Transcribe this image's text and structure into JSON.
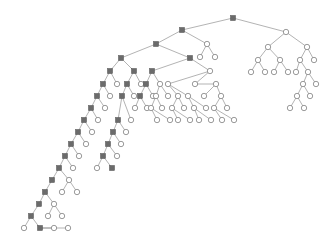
{
  "figure": {
    "kind": "binary-tree-diagram",
    "background_color": "#ffffff",
    "width": 326,
    "height": 245
  },
  "style": {
    "edge_color": "#808080",
    "edge_width": 0.6,
    "square_fill": "#6b6b6b",
    "square_stroke": "#4a4a4a",
    "square_size": 5.2,
    "circle_fill": "#ffffff",
    "circle_stroke": "#707070",
    "circle_radius": 2.7
  },
  "legend": {
    "square_meaning": "internal-marked-node",
    "circle_meaning": "unmarked-node"
  },
  "chart_data": {
    "type": "diagram",
    "title": "",
    "node_shapes": [
      "square",
      "circle"
    ],
    "node_count": 186,
    "root_id": 0,
    "nodes": [
      {
        "id": 0,
        "x": 233,
        "y": 18,
        "shape": "square"
      },
      {
        "id": 1,
        "x": 182,
        "y": 30,
        "shape": "square"
      },
      {
        "id": 2,
        "x": 286,
        "y": 32,
        "shape": "circle"
      },
      {
        "id": 3,
        "x": 156,
        "y": 44,
        "shape": "square"
      },
      {
        "id": 4,
        "x": 207,
        "y": 44,
        "shape": "circle"
      },
      {
        "id": 5,
        "x": 200,
        "y": 57,
        "shape": "circle"
      },
      {
        "id": 6,
        "x": 215,
        "y": 57,
        "shape": "circle"
      },
      {
        "id": 7,
        "x": 268,
        "y": 47,
        "shape": "circle"
      },
      {
        "id": 8,
        "x": 307,
        "y": 47,
        "shape": "circle"
      },
      {
        "id": 9,
        "x": 258,
        "y": 60,
        "shape": "circle"
      },
      {
        "id": 10,
        "x": 280,
        "y": 60,
        "shape": "circle"
      },
      {
        "id": 11,
        "x": 251,
        "y": 72,
        "shape": "circle"
      },
      {
        "id": 12,
        "x": 265,
        "y": 72,
        "shape": "circle"
      },
      {
        "id": 13,
        "x": 274,
        "y": 72,
        "shape": "circle"
      },
      {
        "id": 14,
        "x": 288,
        "y": 72,
        "shape": "circle"
      },
      {
        "id": 15,
        "x": 300,
        "y": 60,
        "shape": "circle"
      },
      {
        "id": 16,
        "x": 314,
        "y": 60,
        "shape": "circle"
      },
      {
        "id": 17,
        "x": 296,
        "y": 72,
        "shape": "circle"
      },
      {
        "id": 18,
        "x": 308,
        "y": 72,
        "shape": "circle"
      },
      {
        "id": 19,
        "x": 303,
        "y": 84,
        "shape": "circle"
      },
      {
        "id": 20,
        "x": 316,
        "y": 84,
        "shape": "circle"
      },
      {
        "id": 21,
        "x": 297,
        "y": 96,
        "shape": "circle"
      },
      {
        "id": 22,
        "x": 310,
        "y": 96,
        "shape": "circle"
      },
      {
        "id": 23,
        "x": 290,
        "y": 108,
        "shape": "circle"
      },
      {
        "id": 24,
        "x": 304,
        "y": 108,
        "shape": "circle"
      },
      {
        "id": 25,
        "x": 121,
        "y": 58,
        "shape": "square"
      },
      {
        "id": 26,
        "x": 190,
        "y": 58,
        "shape": "square"
      },
      {
        "id": 27,
        "x": 110,
        "y": 71,
        "shape": "square"
      },
      {
        "id": 28,
        "x": 134,
        "y": 71,
        "shape": "square"
      },
      {
        "id": 29,
        "x": 103,
        "y": 84,
        "shape": "square"
      },
      {
        "id": 30,
        "x": 117,
        "y": 84,
        "shape": "circle"
      },
      {
        "id": 31,
        "x": 127,
        "y": 84,
        "shape": "square"
      },
      {
        "id": 32,
        "x": 141,
        "y": 84,
        "shape": "circle"
      },
      {
        "id": 33,
        "x": 97,
        "y": 96,
        "shape": "square"
      },
      {
        "id": 34,
        "x": 110,
        "y": 96,
        "shape": "circle"
      },
      {
        "id": 35,
        "x": 122,
        "y": 96,
        "shape": "square"
      },
      {
        "id": 36,
        "x": 134,
        "y": 96,
        "shape": "circle"
      },
      {
        "id": 37,
        "x": 91,
        "y": 108,
        "shape": "square"
      },
      {
        "id": 38,
        "x": 105,
        "y": 108,
        "shape": "circle"
      },
      {
        "id": 39,
        "x": 84,
        "y": 120,
        "shape": "square"
      },
      {
        "id": 40,
        "x": 98,
        "y": 120,
        "shape": "circle"
      },
      {
        "id": 41,
        "x": 78,
        "y": 132,
        "shape": "square"
      },
      {
        "id": 42,
        "x": 92,
        "y": 132,
        "shape": "circle"
      },
      {
        "id": 43,
        "x": 71,
        "y": 144,
        "shape": "square"
      },
      {
        "id": 44,
        "x": 86,
        "y": 144,
        "shape": "circle"
      },
      {
        "id": 45,
        "x": 65,
        "y": 156,
        "shape": "square"
      },
      {
        "id": 46,
        "x": 79,
        "y": 156,
        "shape": "circle"
      },
      {
        "id": 47,
        "x": 59,
        "y": 168,
        "shape": "square"
      },
      {
        "id": 48,
        "x": 73,
        "y": 168,
        "shape": "circle"
      },
      {
        "id": 49,
        "x": 52,
        "y": 180,
        "shape": "square"
      },
      {
        "id": 50,
        "x": 69,
        "y": 180,
        "shape": "circle"
      },
      {
        "id": 51,
        "x": 62,
        "y": 192,
        "shape": "circle"
      },
      {
        "id": 52,
        "x": 77,
        "y": 192,
        "shape": "circle"
      },
      {
        "id": 53,
        "x": 45,
        "y": 192,
        "shape": "square"
      },
      {
        "id": 54,
        "x": 39,
        "y": 204,
        "shape": "square"
      },
      {
        "id": 55,
        "x": 54,
        "y": 204,
        "shape": "circle"
      },
      {
        "id": 56,
        "x": 48,
        "y": 216,
        "shape": "circle"
      },
      {
        "id": 57,
        "x": 62,
        "y": 216,
        "shape": "circle"
      },
      {
        "id": 58,
        "x": 31,
        "y": 216,
        "shape": "square"
      },
      {
        "id": 59,
        "x": 24,
        "y": 228,
        "shape": "circle"
      },
      {
        "id": 60,
        "x": 40,
        "y": 228,
        "shape": "square"
      },
      {
        "id": 61,
        "x": 54,
        "y": 228,
        "shape": "circle"
      },
      {
        "id": 62,
        "x": 68,
        "y": 228,
        "shape": "circle"
      },
      {
        "id": 63,
        "x": 118,
        "y": 120,
        "shape": "square"
      },
      {
        "id": 64,
        "x": 131,
        "y": 120,
        "shape": "circle"
      },
      {
        "id": 65,
        "x": 113,
        "y": 132,
        "shape": "square"
      },
      {
        "id": 66,
        "x": 126,
        "y": 132,
        "shape": "circle"
      },
      {
        "id": 67,
        "x": 108,
        "y": 144,
        "shape": "square"
      },
      {
        "id": 68,
        "x": 121,
        "y": 144,
        "shape": "circle"
      },
      {
        "id": 69,
        "x": 103,
        "y": 156,
        "shape": "square"
      },
      {
        "id": 70,
        "x": 117,
        "y": 156,
        "shape": "circle"
      },
      {
        "id": 71,
        "x": 97,
        "y": 168,
        "shape": "circle"
      },
      {
        "id": 72,
        "x": 112,
        "y": 168,
        "shape": "square"
      },
      {
        "id": 73,
        "x": 152,
        "y": 71,
        "shape": "square"
      },
      {
        "id": 74,
        "x": 210,
        "y": 71,
        "shape": "circle"
      },
      {
        "id": 75,
        "x": 146,
        "y": 84,
        "shape": "square"
      },
      {
        "id": 76,
        "x": 160,
        "y": 84,
        "shape": "circle"
      },
      {
        "id": 77,
        "x": 140,
        "y": 96,
        "shape": "square"
      },
      {
        "id": 78,
        "x": 153,
        "y": 96,
        "shape": "circle"
      },
      {
        "id": 79,
        "x": 135,
        "y": 108,
        "shape": "circle"
      },
      {
        "id": 80,
        "x": 147,
        "y": 108,
        "shape": "circle"
      },
      {
        "id": 81,
        "x": 156,
        "y": 96,
        "shape": "circle"
      },
      {
        "id": 82,
        "x": 168,
        "y": 96,
        "shape": "circle"
      },
      {
        "id": 83,
        "x": 151,
        "y": 108,
        "shape": "circle"
      },
      {
        "id": 84,
        "x": 162,
        "y": 108,
        "shape": "circle"
      },
      {
        "id": 85,
        "x": 157,
        "y": 120,
        "shape": "circle"
      },
      {
        "id": 86,
        "x": 170,
        "y": 120,
        "shape": "circle"
      },
      {
        "id": 87,
        "x": 168,
        "y": 84,
        "shape": "circle"
      },
      {
        "id": 88,
        "x": 178,
        "y": 96,
        "shape": "circle"
      },
      {
        "id": 89,
        "x": 188,
        "y": 96,
        "shape": "circle"
      },
      {
        "id": 90,
        "x": 172,
        "y": 108,
        "shape": "circle"
      },
      {
        "id": 91,
        "x": 184,
        "y": 108,
        "shape": "circle"
      },
      {
        "id": 92,
        "x": 178,
        "y": 120,
        "shape": "circle"
      },
      {
        "id": 93,
        "x": 190,
        "y": 120,
        "shape": "circle"
      },
      {
        "id": 94,
        "x": 194,
        "y": 108,
        "shape": "circle"
      },
      {
        "id": 95,
        "x": 206,
        "y": 108,
        "shape": "circle"
      },
      {
        "id": 96,
        "x": 199,
        "y": 120,
        "shape": "circle"
      },
      {
        "id": 97,
        "x": 211,
        "y": 120,
        "shape": "circle"
      },
      {
        "id": 98,
        "x": 195,
        "y": 84,
        "shape": "circle"
      },
      {
        "id": 99,
        "x": 216,
        "y": 84,
        "shape": "circle"
      },
      {
        "id": 100,
        "x": 204,
        "y": 96,
        "shape": "circle"
      },
      {
        "id": 101,
        "x": 221,
        "y": 96,
        "shape": "circle"
      },
      {
        "id": 102,
        "x": 214,
        "y": 108,
        "shape": "circle"
      },
      {
        "id": 103,
        "x": 227,
        "y": 108,
        "shape": "circle"
      },
      {
        "id": 104,
        "x": 222,
        "y": 120,
        "shape": "circle"
      },
      {
        "id": 105,
        "x": 234,
        "y": 120,
        "shape": "circle"
      }
    ],
    "edges": [
      [
        0,
        1
      ],
      [
        0,
        2
      ],
      [
        1,
        3
      ],
      [
        1,
        4
      ],
      [
        4,
        5
      ],
      [
        4,
        6
      ],
      [
        2,
        7
      ],
      [
        2,
        8
      ],
      [
        7,
        9
      ],
      [
        7,
        10
      ],
      [
        9,
        11
      ],
      [
        9,
        12
      ],
      [
        10,
        13
      ],
      [
        10,
        14
      ],
      [
        8,
        15
      ],
      [
        8,
        16
      ],
      [
        15,
        17
      ],
      [
        15,
        18
      ],
      [
        18,
        19
      ],
      [
        18,
        20
      ],
      [
        19,
        21
      ],
      [
        19,
        22
      ],
      [
        21,
        23
      ],
      [
        21,
        24
      ],
      [
        3,
        25
      ],
      [
        3,
        26
      ],
      [
        25,
        27
      ],
      [
        25,
        28
      ],
      [
        27,
        29
      ],
      [
        27,
        30
      ],
      [
        28,
        31
      ],
      [
        28,
        32
      ],
      [
        29,
        33
      ],
      [
        29,
        34
      ],
      [
        31,
        35
      ],
      [
        31,
        36
      ],
      [
        33,
        37
      ],
      [
        33,
        38
      ],
      [
        37,
        39
      ],
      [
        37,
        40
      ],
      [
        39,
        41
      ],
      [
        39,
        42
      ],
      [
        41,
        43
      ],
      [
        41,
        44
      ],
      [
        43,
        45
      ],
      [
        43,
        46
      ],
      [
        45,
        47
      ],
      [
        45,
        48
      ],
      [
        47,
        49
      ],
      [
        47,
        50
      ],
      [
        50,
        51
      ],
      [
        50,
        52
      ],
      [
        49,
        53
      ],
      [
        53,
        54
      ],
      [
        53,
        55
      ],
      [
        55,
        56
      ],
      [
        55,
        57
      ],
      [
        54,
        58
      ],
      [
        58,
        59
      ],
      [
        58,
        60
      ],
      [
        60,
        61
      ],
      [
        60,
        62
      ],
      [
        35,
        63
      ],
      [
        35,
        64
      ],
      [
        63,
        65
      ],
      [
        63,
        66
      ],
      [
        65,
        67
      ],
      [
        65,
        68
      ],
      [
        67,
        69
      ],
      [
        67,
        70
      ],
      [
        69,
        71
      ],
      [
        69,
        72
      ],
      [
        26,
        73
      ],
      [
        26,
        74
      ],
      [
        73,
        75
      ],
      [
        73,
        76
      ],
      [
        75,
        77
      ],
      [
        75,
        78
      ],
      [
        77,
        79
      ],
      [
        77,
        80
      ],
      [
        76,
        81
      ],
      [
        76,
        82
      ],
      [
        81,
        83
      ],
      [
        81,
        84
      ],
      [
        83,
        85
      ],
      [
        83,
        86
      ],
      [
        74,
        87
      ],
      [
        74,
        98
      ],
      [
        87,
        88
      ],
      [
        87,
        89
      ],
      [
        88,
        90
      ],
      [
        88,
        91
      ],
      [
        90,
        92
      ],
      [
        90,
        93
      ],
      [
        89,
        94
      ],
      [
        89,
        95
      ],
      [
        94,
        96
      ],
      [
        94,
        97
      ],
      [
        98,
        99
      ],
      [
        99,
        100
      ],
      [
        99,
        101
      ],
      [
        101,
        102
      ],
      [
        101,
        103
      ],
      [
        102,
        104
      ],
      [
        102,
        105
      ]
    ]
  }
}
